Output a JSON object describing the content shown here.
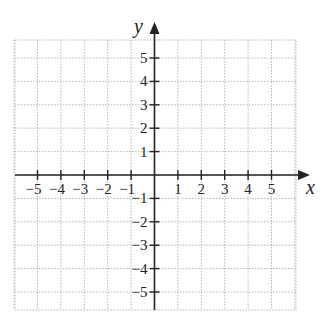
{
  "chart_data": {
    "type": "scatter",
    "title": "",
    "xlabel": "x",
    "ylabel": "y",
    "xlim": [
      -6,
      6
    ],
    "ylim": [
      -6,
      6
    ],
    "grid": true,
    "grid_style": "dotted",
    "x_ticks": [
      -5,
      -4,
      -3,
      -2,
      -1,
      1,
      2,
      3,
      4,
      5
    ],
    "y_ticks": [
      5,
      4,
      3,
      2,
      1,
      -1,
      -2,
      -3,
      -4,
      -5
    ],
    "x_tick_labels": [
      "−5",
      "−4",
      "−3",
      "−2",
      "−1",
      "1",
      "2",
      "3",
      "4",
      "5"
    ],
    "y_tick_labels": [
      "5",
      "4",
      "3",
      "2",
      "1",
      "−1",
      "−2",
      "−3",
      "−4",
      "−5"
    ],
    "series": [],
    "annotations": []
  },
  "axes": {
    "x_name": "x",
    "y_name": "y"
  },
  "colors": {
    "axis": "#222222",
    "grid": "#b8b8b8",
    "background": "#ffffff"
  }
}
